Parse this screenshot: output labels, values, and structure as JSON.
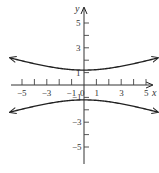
{
  "chart_data": {
    "type": "line",
    "title": "",
    "xlabel": "x",
    "ylabel": "y",
    "xlim": [
      -6,
      6
    ],
    "ylim": [
      -6.5,
      6.5
    ],
    "grid": false,
    "legend": null,
    "x_tick_labels": [
      "-5",
      "-3",
      "-1",
      "0",
      "1",
      "3",
      "5"
    ],
    "y_tick_labels": [
      "5",
      "3",
      "1",
      "-1",
      "-3",
      "-5"
    ],
    "x_ticks_minor_every": 1,
    "y_ticks_minor_every": 1,
    "series": [
      {
        "name": "upper branch",
        "x": [
          -6,
          -5,
          -4,
          -3,
          -2,
          -1,
          0,
          1,
          2,
          3,
          4,
          5,
          6
        ],
        "y": [
          2.2,
          1.93,
          1.68,
          1.5,
          1.33,
          1.24,
          1.2,
          1.24,
          1.33,
          1.5,
          1.68,
          1.93,
          2.2
        ]
      },
      {
        "name": "lower branch",
        "x": [
          -6,
          -5,
          -4,
          -3,
          -2,
          -1,
          0,
          1,
          2,
          3,
          4,
          5,
          6
        ],
        "y": [
          -2.2,
          -1.93,
          -1.68,
          -1.5,
          -1.33,
          -1.24,
          -1.2,
          -1.24,
          -1.33,
          -1.5,
          -1.68,
          -1.93,
          -2.2
        ]
      }
    ]
  }
}
